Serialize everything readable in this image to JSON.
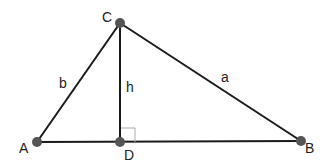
{
  "diagram": {
    "type": "triangle-with-altitude",
    "colors": {
      "line": "#1a1a1a",
      "point": "#555555",
      "right_angle": "#aaaaaa"
    },
    "points": {
      "A": {
        "label": "A",
        "x": 37,
        "y": 142
      },
      "B": {
        "label": "B",
        "x": 301,
        "y": 141
      },
      "C": {
        "label": "C",
        "x": 120,
        "y": 23
      },
      "D": {
        "label": "D",
        "x": 120,
        "y": 142
      }
    },
    "sides": {
      "a": {
        "label": "a",
        "from": "C",
        "to": "B"
      },
      "b": {
        "label": "b",
        "from": "A",
        "to": "C"
      },
      "h": {
        "label": "h",
        "from": "C",
        "to": "D"
      }
    },
    "right_angle_at": "D"
  }
}
